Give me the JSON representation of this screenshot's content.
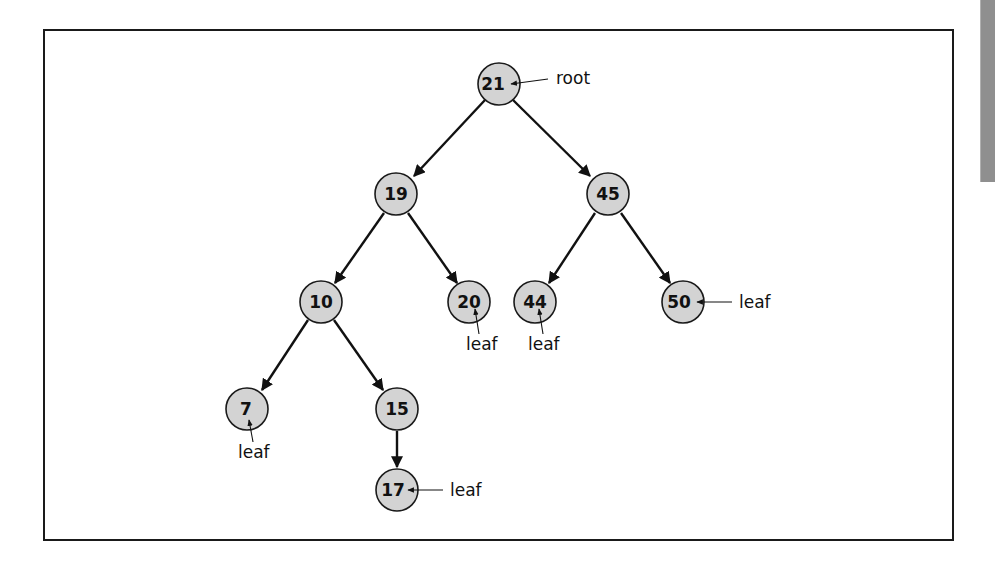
{
  "diagram": {
    "type": "binary-search-tree",
    "colors": {
      "node_fill": "#d3d3d3",
      "node_stroke": "#1a1a1a",
      "edge": "#111111",
      "frame": "#1a1a1a",
      "side_tab": "#8f8f8f"
    },
    "nodes": [
      {
        "id": "n21",
        "value": "21",
        "x": 499,
        "y": 84
      },
      {
        "id": "n19",
        "value": "19",
        "x": 396,
        "y": 194
      },
      {
        "id": "n45",
        "value": "45",
        "x": 608,
        "y": 194
      },
      {
        "id": "n10",
        "value": "10",
        "x": 321,
        "y": 302
      },
      {
        "id": "n20",
        "value": "20",
        "x": 469,
        "y": 302
      },
      {
        "id": "n44",
        "value": "44",
        "x": 535,
        "y": 302
      },
      {
        "id": "n50",
        "value": "50",
        "x": 683,
        "y": 302
      },
      {
        "id": "n7",
        "value": "7",
        "x": 247,
        "y": 409
      },
      {
        "id": "n15",
        "value": "15",
        "x": 397,
        "y": 409
      },
      {
        "id": "n17",
        "value": "17",
        "x": 397,
        "y": 490
      }
    ],
    "edges": [
      {
        "from": "21",
        "to": "19"
      },
      {
        "from": "21",
        "to": "45"
      },
      {
        "from": "19",
        "to": "10"
      },
      {
        "from": "19",
        "to": "20"
      },
      {
        "from": "45",
        "to": "44"
      },
      {
        "from": "45",
        "to": "50"
      },
      {
        "from": "10",
        "to": "7"
      },
      {
        "from": "10",
        "to": "15"
      },
      {
        "from": "15",
        "to": "17"
      }
    ],
    "annotations": [
      {
        "text": "root",
        "target": "21",
        "position": "right"
      },
      {
        "text": "leaf",
        "target": "20",
        "position": "below"
      },
      {
        "text": "leaf",
        "target": "44",
        "position": "below"
      },
      {
        "text": "leaf",
        "target": "50",
        "position": "right"
      },
      {
        "text": "leaf",
        "target": "7",
        "position": "below"
      },
      {
        "text": "leaf",
        "target": "17",
        "position": "right"
      }
    ],
    "labels": {
      "n21": "21",
      "n19": "19",
      "n45": "45",
      "n10": "10",
      "n20": "20",
      "n44": "44",
      "n50": "50",
      "n7": "7",
      "n15": "15",
      "n17": "17",
      "root": "root",
      "leaf_20": "leaf",
      "leaf_44": "leaf",
      "leaf_50": "leaf",
      "leaf_7": "leaf",
      "leaf_17": "leaf"
    }
  }
}
